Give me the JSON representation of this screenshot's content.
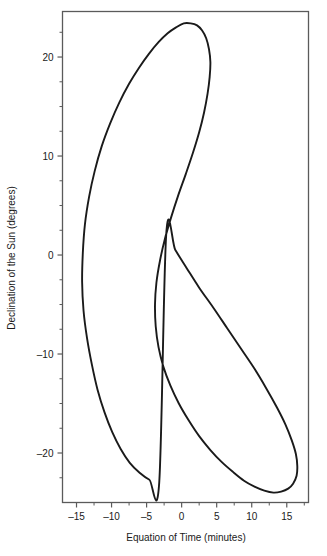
{
  "chart_data": {
    "type": "line",
    "title": "",
    "xlabel": "Equation of Time (minutes)",
    "ylabel": "Declination of the Sun (degrees)",
    "xlim": [
      -17.0,
      18.1
    ],
    "ylim": [
      -25.0,
      24.6
    ],
    "xticks": [
      -15,
      -10,
      -5,
      0,
      5,
      10,
      15
    ],
    "xticklabels": [
      "–15",
      "–10",
      "–5",
      "0",
      "5",
      "10",
      "15"
    ],
    "yticks": [
      20,
      10,
      0,
      -10,
      -20
    ],
    "yticklabels": [
      "20",
      "10",
      "0",
      "–10",
      "–20"
    ],
    "xminorticks": [
      -17.5,
      -12.5,
      -7.5,
      -2.5,
      2.5,
      7.5,
      12.5,
      17.5
    ],
    "yminorticks": [
      22.5,
      17.5,
      15,
      12.5,
      7.5,
      5,
      2.5,
      -2.5,
      -5,
      -7.5,
      -12.5,
      -15,
      -17.5,
      -22.5
    ],
    "grid": false,
    "legend": null,
    "line_color": "#1a1a1a",
    "line_width": 1.9,
    "frame_color": "#5a5a5a",
    "background": "#ffffff",
    "series": [
      {
        "name": "Analemma",
        "closed": true,
        "x": [
          -3.2,
          -4.6,
          -6.0,
          -7.4,
          -8.7,
          -9.9,
          -11.0,
          -12.0,
          -12.8,
          -13.5,
          -14.0,
          -14.2,
          -14.1,
          -13.8,
          -13.2,
          -12.4,
          -11.4,
          -10.2,
          -8.9,
          -7.5,
          -6.1,
          -4.7,
          -3.3,
          -2.0,
          -0.8,
          0.3,
          1.3,
          2.2,
          2.9,
          3.5,
          3.9,
          4.1,
          4.0,
          3.7,
          3.2,
          2.5,
          1.6,
          0.6,
          -0.5,
          -1.5,
          -2.4,
          -3.1,
          -3.6,
          -3.8,
          -3.7,
          -3.3,
          -2.6,
          -1.6,
          -0.4,
          1.0,
          2.5,
          4.1,
          5.7,
          7.3,
          8.9,
          10.4,
          11.8,
          13.1,
          14.2,
          15.2,
          15.9,
          16.4,
          16.5,
          16.3,
          15.7,
          14.8,
          13.6,
          12.1,
          10.4,
          8.5,
          6.5,
          4.5,
          2.5,
          0.7,
          -0.9,
          -2.2
        ],
        "y": [
          -23.0,
          -22.7,
          -22.0,
          -21.0,
          -19.6,
          -17.9,
          -15.9,
          -13.6,
          -11.1,
          -8.4,
          -5.6,
          -2.7,
          0.2,
          3.1,
          5.9,
          8.5,
          11.0,
          13.3,
          15.4,
          17.3,
          18.9,
          20.3,
          21.5,
          22.4,
          23.0,
          23.4,
          23.4,
          23.2,
          22.7,
          21.9,
          20.8,
          19.5,
          18.0,
          16.3,
          14.4,
          12.4,
          10.3,
          8.2,
          6.0,
          3.8,
          1.6,
          -0.6,
          -2.8,
          -5.0,
          -7.2,
          -9.3,
          -11.3,
          -13.2,
          -15.0,
          -16.7,
          -18.3,
          -19.7,
          -20.9,
          -21.9,
          -22.8,
          -23.4,
          -23.8,
          -24.0,
          -23.9,
          -23.6,
          -23.1,
          -22.3,
          -21.3,
          -20.1,
          -18.7,
          -17.1,
          -15.4,
          -13.5,
          -11.5,
          -9.5,
          -7.4,
          -5.3,
          -3.3,
          -1.3,
          0.5,
          2.1
        ],
        "annotations": {
          "max_declination": 23.4,
          "min_declination": -23.4,
          "max_eot": 16.5,
          "min_eot": -14.2,
          "crossing_point": {
            "x": 0.7,
            "y": 8.8
          }
        }
      }
    ]
  }
}
